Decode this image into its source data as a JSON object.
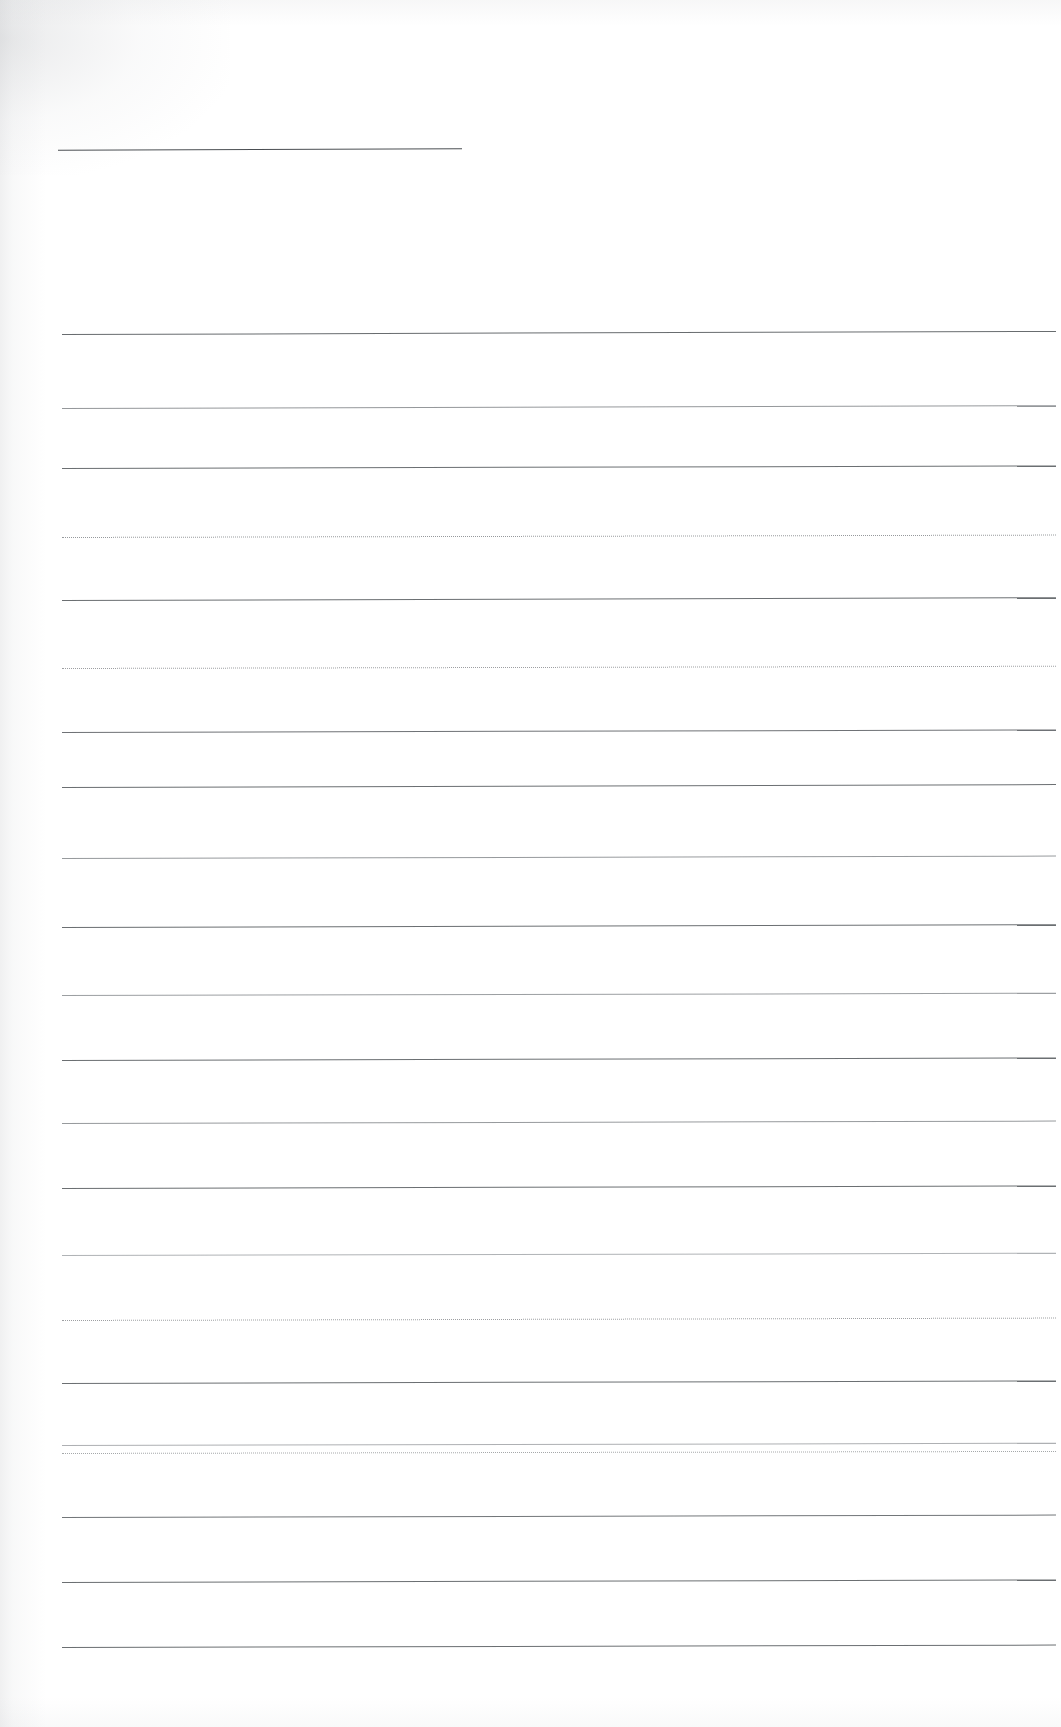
{
  "document": {
    "title": "Blank ruled notepaper scan",
    "kind": "scanned-lined-paper",
    "page_width": 1061,
    "page_height": 1727,
    "background_color": "#ffffff",
    "rule_color": "#5b5f63",
    "header_rule_color": "#4a4e52",
    "written_text": "",
    "margin_left": 62,
    "margin_right": 1056
  },
  "header_rule": {
    "label": "header-rule",
    "x": 58,
    "y": 149,
    "width": 404,
    "thickness": 1,
    "color": "#4a4e52"
  },
  "rules": [
    {
      "index": 1,
      "y": 334,
      "x": 62,
      "width": 994,
      "style": "solid",
      "tilt": -0.18,
      "opacity": 0.92
    },
    {
      "index": 2,
      "y": 408,
      "x": 62,
      "width": 994,
      "style": "light",
      "tilt": -0.16,
      "opacity": 0.8
    },
    {
      "index": 3,
      "y": 468,
      "x": 62,
      "width": 994,
      "style": "solid",
      "tilt": -0.15,
      "opacity": 0.9
    },
    {
      "index": 4,
      "y": 537,
      "x": 62,
      "width": 994,
      "style": "dotted",
      "tilt": -0.14,
      "opacity": 0.7
    },
    {
      "index": 5,
      "y": 600,
      "x": 62,
      "width": 994,
      "style": "solid",
      "tilt": -0.16,
      "opacity": 0.9
    },
    {
      "index": 6,
      "y": 668,
      "x": 62,
      "width": 994,
      "style": "dotted",
      "tilt": -0.13,
      "opacity": 0.66
    },
    {
      "index": 7,
      "y": 732,
      "x": 62,
      "width": 994,
      "style": "solid",
      "tilt": -0.15,
      "opacity": 0.88
    },
    {
      "index": 8,
      "y": 787,
      "x": 62,
      "width": 994,
      "style": "solid",
      "tilt": -0.17,
      "opacity": 0.9
    },
    {
      "index": 9,
      "y": 858,
      "x": 62,
      "width": 994,
      "style": "light",
      "tilt": -0.14,
      "opacity": 0.78
    },
    {
      "index": 10,
      "y": 927,
      "x": 62,
      "width": 994,
      "style": "solid",
      "tilt": -0.16,
      "opacity": 0.9
    },
    {
      "index": 11,
      "y": 995,
      "x": 62,
      "width": 994,
      "style": "light",
      "tilt": -0.13,
      "opacity": 0.74
    },
    {
      "index": 12,
      "y": 1060,
      "x": 62,
      "width": 994,
      "style": "solid",
      "tilt": -0.15,
      "opacity": 0.9
    },
    {
      "index": 13,
      "y": 1123,
      "x": 62,
      "width": 994,
      "style": "light",
      "tilt": -0.14,
      "opacity": 0.78
    },
    {
      "index": 14,
      "y": 1188,
      "x": 62,
      "width": 994,
      "style": "solid",
      "tilt": -0.15,
      "opacity": 0.9
    },
    {
      "index": 15,
      "y": 1255,
      "x": 62,
      "width": 994,
      "style": "faint",
      "tilt": -0.13,
      "opacity": 0.68
    },
    {
      "index": 16,
      "y": 1320,
      "x": 62,
      "width": 994,
      "style": "dotted",
      "tilt": -0.14,
      "opacity": 0.66
    },
    {
      "index": 17,
      "y": 1383,
      "x": 62,
      "width": 994,
      "style": "solid",
      "tilt": -0.15,
      "opacity": 0.9
    },
    {
      "index": 18,
      "y": 1445,
      "x": 62,
      "width": 994,
      "style": "faint",
      "tilt": -0.13,
      "opacity": 0.7
    },
    {
      "index": 19,
      "y": 1453,
      "x": 62,
      "width": 994,
      "style": "dotted",
      "tilt": -0.12,
      "opacity": 0.6
    },
    {
      "index": 20,
      "y": 1517,
      "x": 62,
      "width": 994,
      "style": "solid",
      "tilt": -0.14,
      "opacity": 0.86
    },
    {
      "index": 21,
      "y": 1582,
      "x": 62,
      "width": 994,
      "style": "solid",
      "tilt": -0.15,
      "opacity": 0.9
    },
    {
      "index": 22,
      "y": 1647,
      "x": 62,
      "width": 994,
      "style": "solid",
      "tilt": -0.14,
      "opacity": 0.9
    }
  ]
}
